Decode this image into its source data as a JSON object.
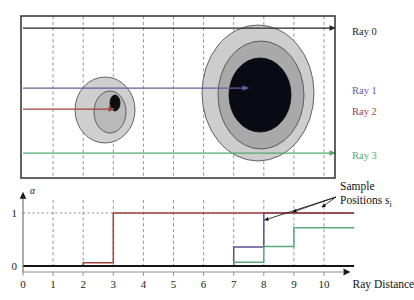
{
  "figure": {
    "title": "",
    "top_panel": {
      "name": "scene-panel",
      "border_color": "#3b3b3b",
      "gridline_color": "#8a8a8a",
      "blobs": [
        {
          "id": "small-blob",
          "cx": 105,
          "cy": 110,
          "layers": [
            {
              "rx": 30,
              "ry": 33,
              "fill": "#cfcfcf",
              "stroke": "#4a4a4a"
            },
            {
              "rx": 16,
              "ry": 21,
              "fill": "#b9b9b9",
              "stroke": "#4a4a4a",
              "dx": 5,
              "dy": 2
            },
            {
              "rx": 5,
              "ry": 8,
              "fill": "#0d0d0d",
              "stroke": "#0d0d0d",
              "dx": 10,
              "dy": -7
            }
          ]
        },
        {
          "id": "large-blob",
          "cx": 258,
          "cy": 93,
          "layers": [
            {
              "rx": 56,
              "ry": 68,
              "fill": "#cdcdcd",
              "stroke": "#4a4a4a"
            },
            {
              "rx": 43,
              "ry": 54,
              "fill": "#a9a9a9",
              "stroke": "#4a4a4a",
              "dx": 3,
              "dy": 2
            },
            {
              "rx": 31,
              "ry": 37,
              "fill": "#0a0a14",
              "stroke": "#0a0a14",
              "dx": 2,
              "dy": 2
            }
          ]
        }
      ]
    },
    "rays": [
      {
        "id": "ray-0",
        "label": "Ray 0",
        "color": "#252525",
        "y": 28,
        "x_start": 23,
        "x_end": 335,
        "label_y": 31
      },
      {
        "id": "ray-1",
        "label": "Ray 1",
        "color": "#6a5aa0",
        "y": 88,
        "x_start": 23,
        "x_end": 248,
        "label_y": 90
      },
      {
        "id": "ray-2",
        "label": "Ray 2",
        "color": "#9e4437",
        "y": 109,
        "x_start": 23,
        "x_end": 114,
        "label_y": 111
      },
      {
        "id": "ray-3",
        "label": "Ray 3",
        "color": "#52a96e",
        "y": 153,
        "x_start": 23,
        "x_end": 335,
        "label_y": 155
      }
    ],
    "ray_label_x": 352,
    "annotation": {
      "text": "Sample",
      "text2": "Positions s",
      "subscript": "i",
      "x": 340,
      "y1": 190,
      "y2": 203
    },
    "chart_axes": {
      "x_axis_label": "Ray Distance",
      "y_axis_label": "α",
      "y_tick_labels": [
        "1",
        "0"
      ],
      "x_tick_labels": [
        "0",
        "1",
        "2",
        "3",
        "4",
        "5",
        "6",
        "7",
        "8",
        "9",
        "10"
      ]
    }
  },
  "chart_data": {
    "type": "line",
    "title": "",
    "xlabel": "Ray Distance",
    "ylabel": "α",
    "xlim": [
      0,
      11
    ],
    "ylim": [
      0,
      1.15
    ],
    "xticks": [
      0,
      1,
      2,
      3,
      4,
      5,
      6,
      7,
      8,
      9,
      10
    ],
    "yticks": [
      0,
      1
    ],
    "ytick_labels": [
      "0",
      "1"
    ],
    "grid": "vertical-dashed",
    "legend": "right-of-scene",
    "interpolation": "step-post",
    "annotations": [
      {
        "text": "Sample Positions s_i",
        "points_to": [
          [
            8,
            1.0
          ],
          [
            9,
            1.0
          ],
          [
            10,
            1.0
          ]
        ]
      }
    ],
    "series": [
      {
        "name": "Ray 0",
        "color": "#14141e",
        "linewidth": 2.2,
        "x": [
          0,
          1,
          2,
          3,
          4,
          5,
          6,
          7,
          8,
          9,
          10,
          11
        ],
        "values": [
          0,
          0,
          0,
          0,
          0,
          0,
          0,
          0,
          0,
          0,
          0,
          0
        ]
      },
      {
        "name": "Ray 1",
        "color": "#5b4f93",
        "linewidth": 1.5,
        "x": [
          0,
          1,
          2,
          3,
          4,
          5,
          6,
          7,
          8,
          9,
          10,
          11
        ],
        "values": [
          0,
          0,
          0,
          0,
          0,
          0,
          0,
          0.36,
          1.0,
          1.0,
          1.0,
          1.0
        ]
      },
      {
        "name": "Ray 2",
        "color": "#9e4437",
        "linewidth": 1.5,
        "x": [
          0,
          1,
          2,
          3,
          4,
          5,
          6,
          7,
          8,
          9,
          10,
          11
        ],
        "values": [
          0,
          0,
          0.06,
          1.0,
          1.0,
          1.0,
          1.0,
          1.0,
          1.0,
          1.0,
          1.0,
          1.0
        ]
      },
      {
        "name": "Ray 3",
        "color": "#5aa878",
        "linewidth": 1.5,
        "x": [
          0,
          1,
          2,
          3,
          4,
          5,
          6,
          7,
          8,
          9,
          10,
          11
        ],
        "values": [
          0,
          0,
          0,
          0,
          0,
          0,
          0,
          0.07,
          0.37,
          0.72,
          0.72,
          0.72
        ]
      }
    ]
  }
}
